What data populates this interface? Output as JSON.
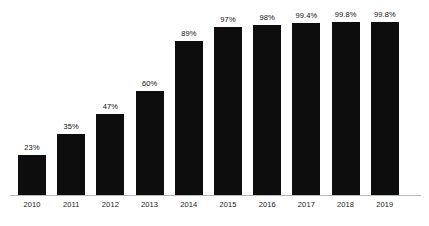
{
  "chart_data": {
    "type": "bar",
    "title": "",
    "subtitle": "",
    "xlabel": "",
    "ylabel": "",
    "categories": [
      "2010",
      "2011",
      "2012",
      "2013",
      "2014",
      "2015",
      "2016",
      "2017",
      "2018",
      "2019"
    ],
    "values": [
      23,
      35,
      47,
      60,
      89,
      97,
      98,
      99.4,
      99.8,
      99.8
    ],
    "value_labels": [
      "23%",
      "35%",
      "47%",
      "60%",
      "89%",
      "97%",
      "98%",
      "99.4%",
      "99.8%",
      "99.8%"
    ],
    "ylim": [
      0,
      100
    ],
    "grid": false,
    "legend": null,
    "series": [
      {
        "name": "",
        "values": [
          23,
          35,
          47,
          60,
          89,
          97,
          98,
          99.4,
          99.8,
          99.8
        ]
      }
    ]
  },
  "style": {
    "background": "#ffffff",
    "bar_color": "#0d0d0d",
    "axis_color": "#b9b9b9",
    "label_color": "#111111"
  }
}
